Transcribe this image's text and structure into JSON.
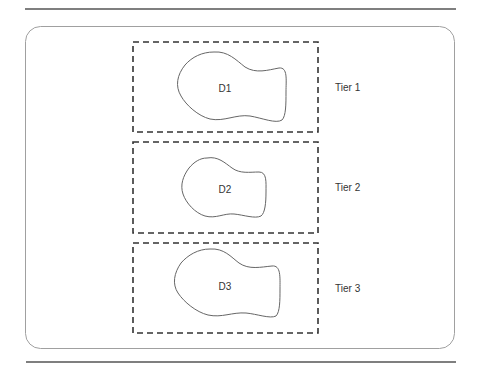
{
  "diagram": {
    "type": "tiered-regions",
    "colors": {
      "rule": "#555555",
      "container_border": "#9a9a9a",
      "dashed_box": "#333333",
      "blob_stroke": "#666666",
      "text": "#333333"
    },
    "tiers": [
      {
        "region_label": "D1",
        "tier_label": "Tier 1"
      },
      {
        "region_label": "D2",
        "tier_label": "Tier 2"
      },
      {
        "region_label": "D3",
        "tier_label": "Tier 3"
      }
    ]
  }
}
